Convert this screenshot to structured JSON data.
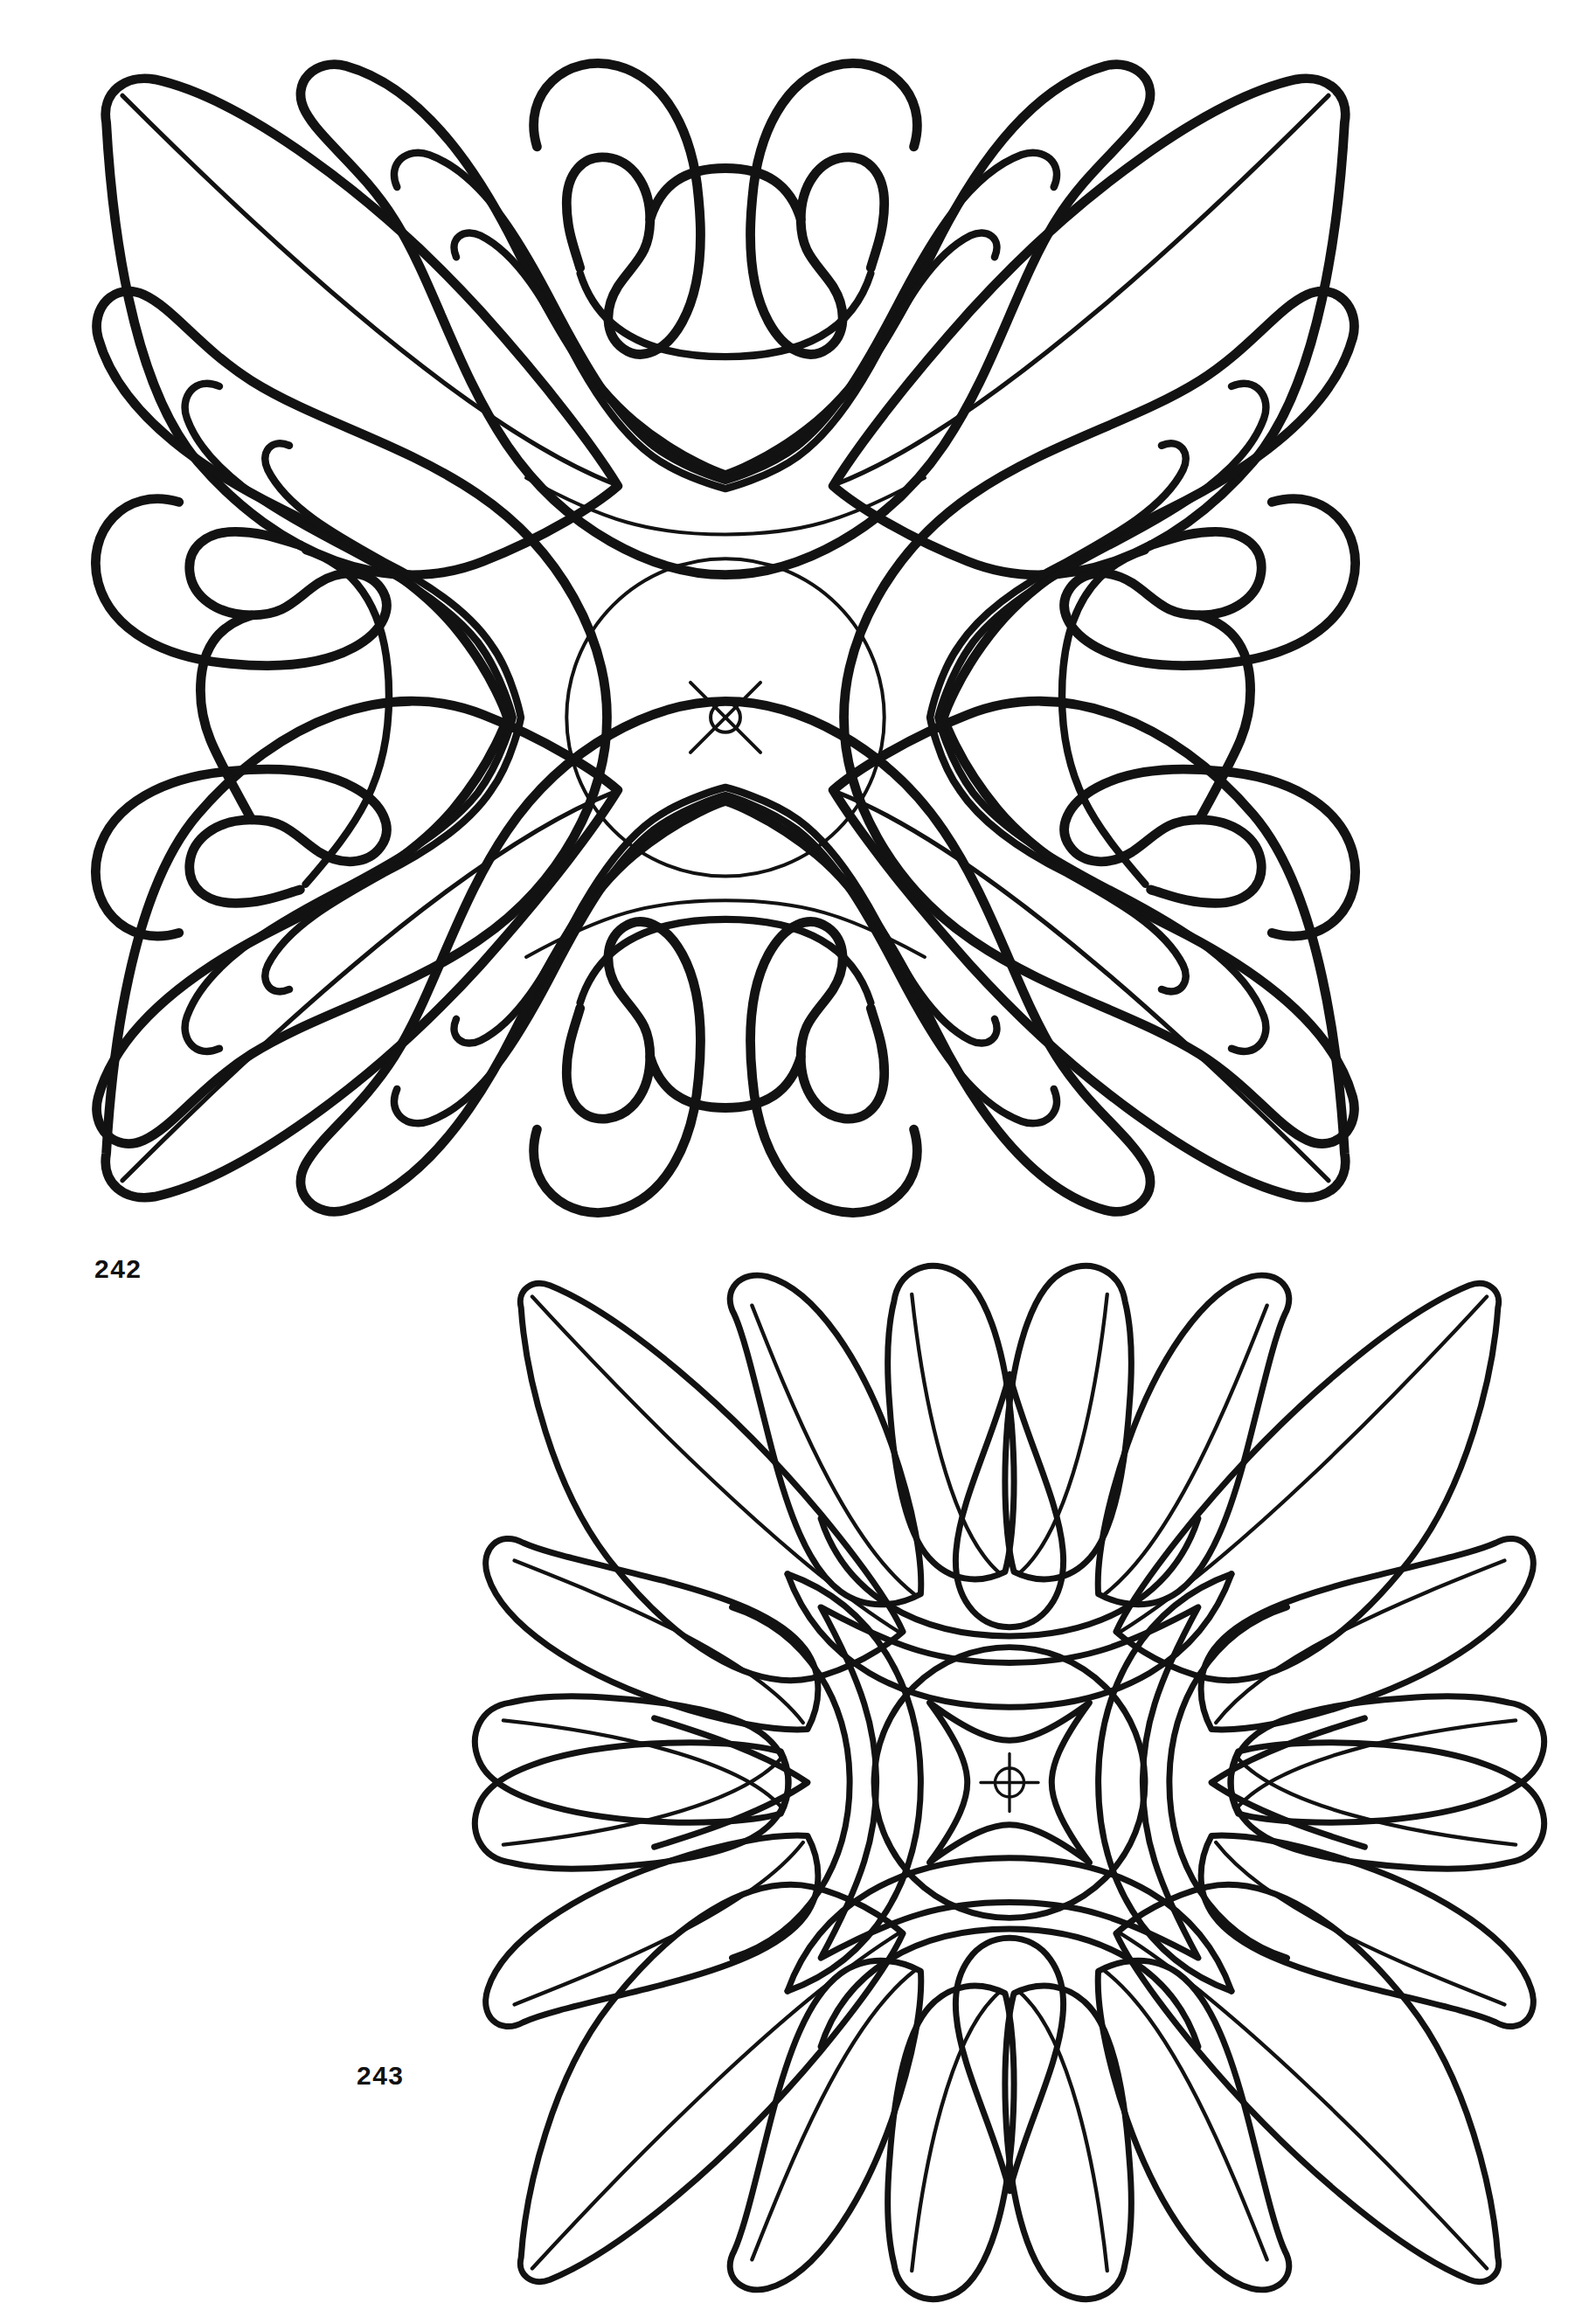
{
  "page": {
    "background_color": "#ffffff",
    "ink_color": "#121212",
    "kind": "ornament-plate",
    "figure_count": 2
  },
  "figures": [
    {
      "number": "242",
      "label": "242",
      "title": "Square acanthus rosette",
      "description": "Square patera with four-fold symmetry: diagonal corner leaves with centre veins, C-scroll volutes on each side, scrolled acanthus lobes at top and bottom centre, and a plain circular central boss.",
      "center_mark": "x-cross-with-small-circle",
      "has_center_boss": true,
      "boss_shape": "plain-circle"
    },
    {
      "number": "243",
      "label": "243",
      "title": "Square petal rosette",
      "description": "Square patera with four-fold symmetry: diagonal corner leaves with veins, paired rounded petal lobes along every edge, a teardrop at each edge centre, and a circular central boss containing a concave-sided square.",
      "center_mark": "crosshair-circle",
      "has_center_boss": true,
      "boss_shape": "circle-with-concave-square"
    }
  ],
  "colors": {
    "paper": "#ffffff",
    "ink": "#121212",
    "label": "#111111"
  }
}
